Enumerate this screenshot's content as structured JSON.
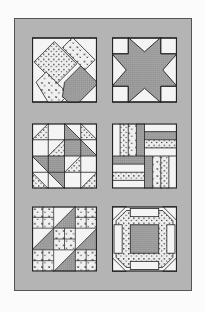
{
  "illustration": {
    "subject": "quilt block samples",
    "layout": {
      "rows": 3,
      "columns": 2
    },
    "colors": {
      "page_background": "#fbfbfb",
      "frame_background": "#b4b4b4",
      "line": "#222222",
      "light_fabric": "#f2f2f2",
      "dark_fabric": "#9a9a9a",
      "dotted_fabric_base": "#eeeeee"
    },
    "blocks": [
      {
        "position": "top-left",
        "pattern": "interlocking diagonal bars",
        "fabrics": [
          "dotted",
          "sprig",
          "gray"
        ]
      },
      {
        "position": "top-right",
        "pattern": "eight-point star",
        "fabrics": [
          "gray",
          "white"
        ]
      },
      {
        "position": "middle-left",
        "pattern": "triangle squares (birds in the air)",
        "fabrics": [
          "dotted",
          "gray",
          "white"
        ]
      },
      {
        "position": "middle-right",
        "pattern": "rail fence",
        "fabrics": [
          "dotted",
          "sprig",
          "white"
        ]
      },
      {
        "position": "bottom-left",
        "pattern": "jacob's ladder",
        "fabrics": [
          "sprig",
          "gray",
          "white"
        ]
      },
      {
        "position": "bottom-right",
        "pattern": "churn dash / monkey wrench variant",
        "fabrics": [
          "dotted",
          "gray",
          "white"
        ]
      }
    ]
  }
}
